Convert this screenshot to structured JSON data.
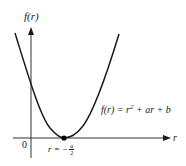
{
  "diagram": {
    "type": "function-graph",
    "y_axis_label": "f(r)",
    "x_axis_label": "r",
    "origin_label": "0",
    "curve_equation": {
      "lhs": "f(r) = r",
      "exponent": "2",
      "rhs": " + ar + b",
      "full_text": "f(r) = r^2 + ar + b"
    },
    "vertex_label": {
      "prefix": "r = −",
      "numerator": "a",
      "denominator": "2",
      "full_text": "r = −a/2"
    },
    "colors": {
      "line": "#1a1a1a",
      "axis": "#333333",
      "background": "#ffffff"
    }
  }
}
